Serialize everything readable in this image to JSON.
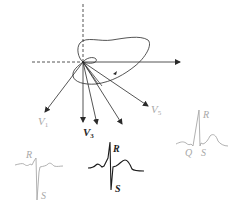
{
  "diagram": {
    "colors": {
      "primary": "#2a2a2a",
      "faint": "#a8a8a8",
      "background": "#ffffff"
    },
    "axes": {
      "vertical": "dashed-above-origin",
      "horizontal": "dashed-left-solid-right-arrow"
    },
    "lead_labels": [
      {
        "id": "v1",
        "main": "V",
        "sub": "1"
      },
      {
        "id": "v3",
        "main": "V",
        "sub": "3"
      },
      {
        "id": "v5",
        "main": "V",
        "sub": "5"
      }
    ],
    "waveforms": [
      {
        "id": "v1-wave",
        "labels": [
          "R",
          "S"
        ],
        "emphasis": "faint"
      },
      {
        "id": "v3-wave",
        "labels": [
          "R",
          "S"
        ],
        "emphasis": "strong"
      },
      {
        "id": "v5-wave",
        "labels": [
          "R",
          "Q",
          "S"
        ],
        "emphasis": "faint"
      }
    ]
  }
}
